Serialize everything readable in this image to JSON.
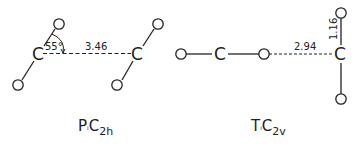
{
  "diagram": {
    "left": {
      "caption": {
        "main": "P",
        "sep": "ᵢ",
        "c": "C",
        "sub": "2h"
      },
      "angle_label": "55°",
      "distance_label": "3.46",
      "atoms": {
        "carbon": "C",
        "oxygen": "O"
      }
    },
    "right": {
      "caption": {
        "main": "T",
        "sep": "ᵢ",
        "c": "C",
        "sub": "2v"
      },
      "distance_label": "2.94",
      "bond_label": "1.16",
      "atoms": {
        "carbon": "C",
        "oxygen": "O"
      }
    }
  }
}
